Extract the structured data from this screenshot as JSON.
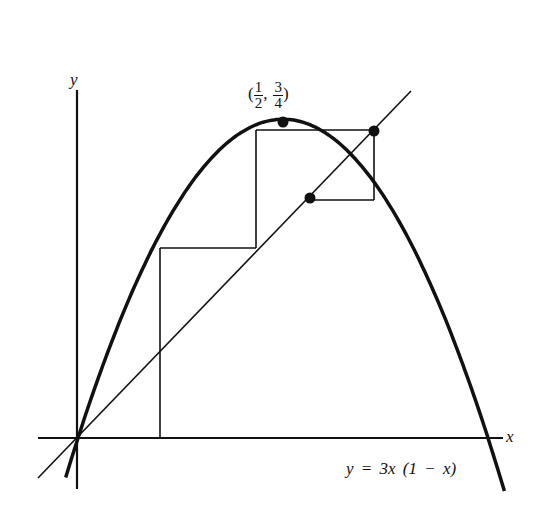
{
  "figure": {
    "axis_labels": {
      "x": "x",
      "y": "y"
    },
    "equation_label": "y = 3x (1 − x)",
    "peak_label": {
      "open": "(",
      "x_num": "1",
      "x_den": "2",
      "sep": ",",
      "y_num": "3",
      "y_den": "4",
      "close": ")"
    },
    "function": "y = 3x(1 - x)",
    "diagonal": "y = x",
    "peak_point": [
      0.5,
      0.75
    ],
    "cobweb_points": [
      [
        0.2,
        0.48
      ],
      [
        0.48,
        0.75
      ],
      [
        0.75,
        0.5625
      ]
    ],
    "highlighted_points": [
      [
        0.5,
        0.75
      ],
      [
        0.75,
        0.75
      ],
      [
        0.5625,
        0.5625
      ]
    ],
    "colors": {
      "ink": "#111111",
      "background": "#ffffff"
    }
  }
}
